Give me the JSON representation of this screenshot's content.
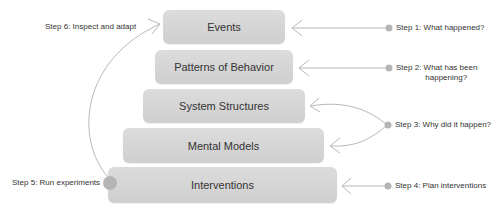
{
  "diagram": {
    "levels": [
      {
        "label": "Events"
      },
      {
        "label": "Patterns of Behavior"
      },
      {
        "label": "System Structures"
      },
      {
        "label": "Mental Models"
      },
      {
        "label": "Interventions"
      }
    ],
    "steps": [
      {
        "label": "Step 1: What happened?"
      },
      {
        "label_line1": "Step 2: What has been",
        "label_line2": "happening?"
      },
      {
        "label": "Step 3: Why did it happen?"
      },
      {
        "label": "Step 4: Plan interventions"
      },
      {
        "label": "Step 5: Run experiments"
      },
      {
        "label": "Step 6: Inspect and adapt"
      }
    ],
    "colors": {
      "box": "#d6d6d6",
      "line": "#b5b5b5",
      "dot": "#b0b0b0",
      "text": "#333333"
    }
  }
}
